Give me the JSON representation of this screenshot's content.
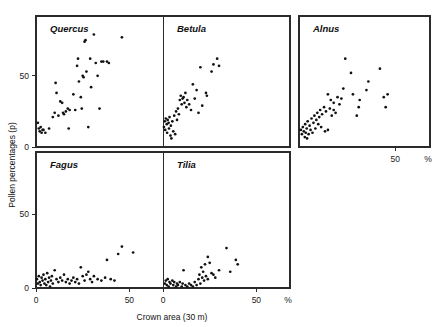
{
  "figure": {
    "xlabel": "Crown area (30 m)",
    "ylabel": "Pollen percentages (p)",
    "percent_symbol": "%",
    "background": "#ffffff",
    "ink": "#111111"
  },
  "chart_data": {
    "type": "scatter",
    "title": "",
    "xlabel": "Crown area (30 m)",
    "ylabel": "Pollen percentages (p)",
    "xlim": [
      0,
      100
    ],
    "ylim": [
      0,
      100
    ],
    "xticks": [
      0,
      50
    ],
    "xticklabels": [
      "0",
      "50"
    ],
    "yticks": [
      0,
      50
    ],
    "yticklabels": [
      "0",
      "50"
    ],
    "grid": false,
    "legend": "none",
    "unit_annotation": "%",
    "panel_layout": {
      "rows": 2,
      "cols": 3,
      "empty_cells": [
        "row2-col3"
      ]
    },
    "panels": [
      {
        "name": "Quercus",
        "row": 1,
        "col": 1,
        "xticklabels": [],
        "yticklabels": [
          "0",
          "50"
        ],
        "points": [
          [
            1,
            17
          ],
          [
            1.5,
            13
          ],
          [
            2,
            11
          ],
          [
            2.5,
            14
          ],
          [
            3,
            10
          ],
          [
            3.5,
            12
          ],
          [
            4,
            12
          ],
          [
            5,
            10
          ],
          [
            7,
            13
          ],
          [
            9,
            21
          ],
          [
            10,
            24
          ],
          [
            10.5,
            45
          ],
          [
            11,
            38
          ],
          [
            12,
            22
          ],
          [
            13,
            32
          ],
          [
            14,
            31
          ],
          [
            14.5,
            24
          ],
          [
            15,
            23
          ],
          [
            16,
            25
          ],
          [
            17,
            27
          ],
          [
            17.5,
            13
          ],
          [
            18,
            26
          ],
          [
            20,
            37
          ],
          [
            21,
            26
          ],
          [
            22,
            57
          ],
          [
            22.5,
            62
          ],
          [
            23,
            46
          ],
          [
            24,
            35
          ],
          [
            24.5,
            27
          ],
          [
            25,
            50
          ],
          [
            25.5,
            49
          ],
          [
            26,
            74
          ],
          [
            26.5,
            75
          ],
          [
            27,
            53
          ],
          [
            28,
            14
          ],
          [
            29,
            62
          ],
          [
            29.5,
            42
          ],
          [
            31,
            79
          ],
          [
            32,
            59
          ],
          [
            33,
            50
          ],
          [
            34,
            27
          ],
          [
            35,
            60
          ],
          [
            36,
            60
          ],
          [
            38,
            60
          ],
          [
            39,
            59
          ],
          [
            46,
            77
          ]
        ]
      },
      {
        "name": "Betula",
        "row": 1,
        "col": 2,
        "xticklabels": [],
        "yticklabels": [],
        "points": [
          [
            0.5,
            14
          ],
          [
            1,
            18
          ],
          [
            1.2,
            12
          ],
          [
            1.5,
            20
          ],
          [
            2,
            16
          ],
          [
            2.2,
            10
          ],
          [
            2.5,
            19
          ],
          [
            3,
            17
          ],
          [
            3.2,
            13
          ],
          [
            3.5,
            21
          ],
          [
            4,
            8
          ],
          [
            4.2,
            15
          ],
          [
            4.5,
            6
          ],
          [
            5,
            18
          ],
          [
            5.5,
            11
          ],
          [
            6,
            22
          ],
          [
            6.5,
            9
          ],
          [
            7,
            25
          ],
          [
            7.5,
            19
          ],
          [
            8,
            27
          ],
          [
            8.5,
            23
          ],
          [
            9,
            33
          ],
          [
            9.5,
            36
          ],
          [
            10,
            30
          ],
          [
            10.5,
            34
          ],
          [
            11,
            35
          ],
          [
            11.5,
            31
          ],
          [
            12,
            38
          ],
          [
            12.5,
            28
          ],
          [
            13,
            33
          ],
          [
            14,
            30
          ],
          [
            15,
            26
          ],
          [
            16,
            44
          ],
          [
            17,
            34
          ],
          [
            18,
            40
          ],
          [
            19,
            24
          ],
          [
            20,
            56
          ],
          [
            21,
            29
          ],
          [
            23,
            38
          ],
          [
            23.5,
            36
          ],
          [
            26,
            53
          ],
          [
            27,
            58
          ],
          [
            29,
            62
          ],
          [
            30,
            57
          ]
        ]
      },
      {
        "name": "Alnus",
        "row": 1,
        "col": 3,
        "xticklabels": [
          "50"
        ],
        "yticklabels": [],
        "points": [
          [
            1,
            12
          ],
          [
            1.5,
            9
          ],
          [
            2,
            14
          ],
          [
            2.5,
            11
          ],
          [
            3,
            7
          ],
          [
            3.2,
            16
          ],
          [
            3.5,
            10
          ],
          [
            4,
            13
          ],
          [
            4.2,
            6
          ],
          [
            4.5,
            18
          ],
          [
            5,
            9
          ],
          [
            5.5,
            15
          ],
          [
            6,
            12
          ],
          [
            6.5,
            20
          ],
          [
            7,
            10
          ],
          [
            7.5,
            17
          ],
          [
            8,
            22
          ],
          [
            8.5,
            13
          ],
          [
            9,
            19
          ],
          [
            9.5,
            24
          ],
          [
            10,
            16
          ],
          [
            10.5,
            21
          ],
          [
            11,
            26
          ],
          [
            11.5,
            14
          ],
          [
            12,
            23
          ],
          [
            13,
            28
          ],
          [
            13.5,
            11
          ],
          [
            14,
            25
          ],
          [
            15,
            12
          ],
          [
            16,
            27
          ],
          [
            17,
            22
          ],
          [
            18,
            26
          ],
          [
            19,
            24
          ],
          [
            15,
            37
          ],
          [
            16.5,
            33
          ],
          [
            18,
            31
          ],
          [
            20,
            35
          ],
          [
            21,
            30
          ],
          [
            22,
            34
          ],
          [
            23,
            41
          ],
          [
            24,
            62
          ],
          [
            27,
            52
          ],
          [
            28,
            37
          ],
          [
            30,
            22
          ],
          [
            31,
            28
          ],
          [
            31.5,
            33
          ],
          [
            35,
            40
          ],
          [
            36,
            46
          ],
          [
            42,
            55
          ],
          [
            44,
            35
          ],
          [
            45,
            28
          ],
          [
            46,
            37
          ]
        ]
      },
      {
        "name": "Fagus",
        "row": 2,
        "col": 1,
        "xticklabels": [
          "0",
          "50"
        ],
        "yticklabels": [
          "0",
          "50"
        ],
        "points": [
          [
            0.5,
            6
          ],
          [
            1,
            3
          ],
          [
            1.5,
            8
          ],
          [
            2,
            4
          ],
          [
            2.5,
            2
          ],
          [
            3,
            7
          ],
          [
            3.5,
            5
          ],
          [
            4,
            9
          ],
          [
            4.5,
            3
          ],
          [
            5,
            6
          ],
          [
            5.5,
            2
          ],
          [
            6,
            10
          ],
          [
            6.5,
            4
          ],
          [
            7,
            7
          ],
          [
            7.5,
            1
          ],
          [
            8,
            5
          ],
          [
            8.5,
            8
          ],
          [
            9,
            3
          ],
          [
            10,
            12
          ],
          [
            11,
            6
          ],
          [
            12,
            4
          ],
          [
            13,
            7
          ],
          [
            14,
            5
          ],
          [
            15,
            9
          ],
          [
            16,
            4
          ],
          [
            17,
            6
          ],
          [
            18,
            3
          ],
          [
            19,
            5
          ],
          [
            20,
            7
          ],
          [
            21,
            4
          ],
          [
            22,
            6
          ],
          [
            23,
            3
          ],
          [
            24,
            14
          ],
          [
            25,
            8
          ],
          [
            26,
            5
          ],
          [
            27,
            9
          ],
          [
            28,
            11
          ],
          [
            29,
            6
          ],
          [
            30,
            4
          ],
          [
            31,
            8
          ],
          [
            33,
            6
          ],
          [
            35,
            5
          ],
          [
            37,
            7
          ],
          [
            38,
            19
          ],
          [
            40,
            6
          ],
          [
            42,
            5
          ],
          [
            44,
            23
          ],
          [
            46,
            28
          ],
          [
            52,
            24
          ]
        ]
      },
      {
        "name": "Tilia",
        "row": 2,
        "col": 2,
        "xticklabels": [
          "0",
          "50"
        ],
        "yticklabels": [],
        "points": [
          [
            1,
            3
          ],
          [
            1.5,
            5
          ],
          [
            2,
            2
          ],
          [
            2.5,
            6
          ],
          [
            3,
            1
          ],
          [
            3.5,
            4
          ],
          [
            4,
            3
          ],
          [
            5,
            5
          ],
          [
            5.5,
            2
          ],
          [
            6,
            4
          ],
          [
            7,
            1
          ],
          [
            7.5,
            3
          ],
          [
            8,
            2
          ],
          [
            9,
            4
          ],
          [
            10,
            1
          ],
          [
            10.5,
            3
          ],
          [
            11,
            12
          ],
          [
            12,
            2
          ],
          [
            13,
            1
          ],
          [
            14,
            3
          ],
          [
            15,
            2
          ],
          [
            16,
            1
          ],
          [
            17,
            4
          ],
          [
            18,
            2
          ],
          [
            19,
            6
          ],
          [
            19.5,
            9
          ],
          [
            20,
            3
          ],
          [
            20.5,
            14
          ],
          [
            21,
            7
          ],
          [
            21.5,
            11
          ],
          [
            22,
            5
          ],
          [
            22.5,
            16
          ],
          [
            23,
            8
          ],
          [
            24,
            6
          ],
          [
            25,
            17
          ],
          [
            26,
            10
          ],
          [
            27,
            9
          ],
          [
            28,
            7
          ],
          [
            24,
            21
          ],
          [
            30,
            12
          ],
          [
            34,
            27
          ],
          [
            36,
            11
          ],
          [
            39,
            19
          ],
          [
            40,
            16
          ]
        ]
      }
    ]
  }
}
